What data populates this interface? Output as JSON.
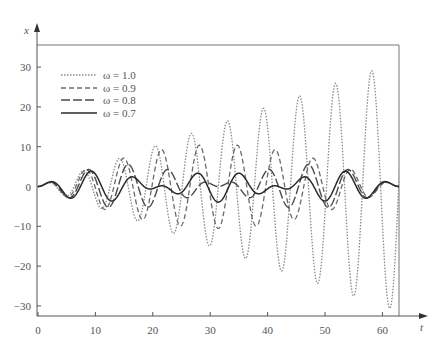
{
  "chart_data": {
    "type": "line",
    "title": "",
    "xlabel": "t",
    "ylabel": "x",
    "xlim": [
      0,
      64
    ],
    "ylim": [
      -33,
      36
    ],
    "grid": false,
    "legend_position": "upper-left",
    "x_ticks": [
      0,
      10,
      20,
      30,
      40,
      50,
      60
    ],
    "x_tick_labels": [
      "0",
      "10",
      "20",
      "30",
      "40",
      "50",
      "60"
    ],
    "y_ticks": [
      30,
      20,
      10,
      0,
      -10,
      -20,
      -30
    ],
    "y_tick_labels": [
      "30",
      "20",
      "10",
      "0",
      "−10",
      "−20",
      "−30"
    ],
    "model": "x'' + x = cos(ωt), x(0)=0, x'(0)=0",
    "series": [
      {
        "name": "ω = 1.0",
        "omega": 1.0,
        "style": "dotted",
        "color": "#8a8a8a",
        "width": 1.3,
        "dash": "1.5,1.5",
        "sample_points": [
          [
            0,
            0
          ],
          [
            7.9,
            3.9
          ],
          [
            14.2,
            7.1
          ],
          [
            20.4,
            10.2
          ],
          [
            26.7,
            13.4
          ],
          [
            33.0,
            16.5
          ],
          [
            39.3,
            19.6
          ],
          [
            45.6,
            22.8
          ],
          [
            51.8,
            25.9
          ],
          [
            58.1,
            29.1
          ],
          [
            61.3,
            30.6
          ]
        ]
      },
      {
        "name": "ω = 0.9",
        "omega": 0.9,
        "style": "dashed",
        "color": "#6a6a6a",
        "width": 1.3,
        "dash": "5,3",
        "envelope_max": 10.5
      },
      {
        "name": "ω = 0.8",
        "omega": 0.8,
        "style": "long-dashed",
        "color": "#4a4a4a",
        "width": 1.4,
        "dash": "9,3",
        "envelope_max": 5.6
      },
      {
        "name": "ω = 0.7",
        "omega": 0.7,
        "style": "solid",
        "color": "#2a2a2a",
        "width": 1.5,
        "dash": "",
        "envelope_max": 3.9
      }
    ]
  },
  "legend": {
    "items": [
      {
        "label": "ω = 1.0"
      },
      {
        "label": "ω = 0.9"
      },
      {
        "label": "ω = 0.8"
      },
      {
        "label": "ω = 0.7"
      }
    ]
  },
  "axes": {
    "x_label": "t",
    "y_label": "x"
  }
}
